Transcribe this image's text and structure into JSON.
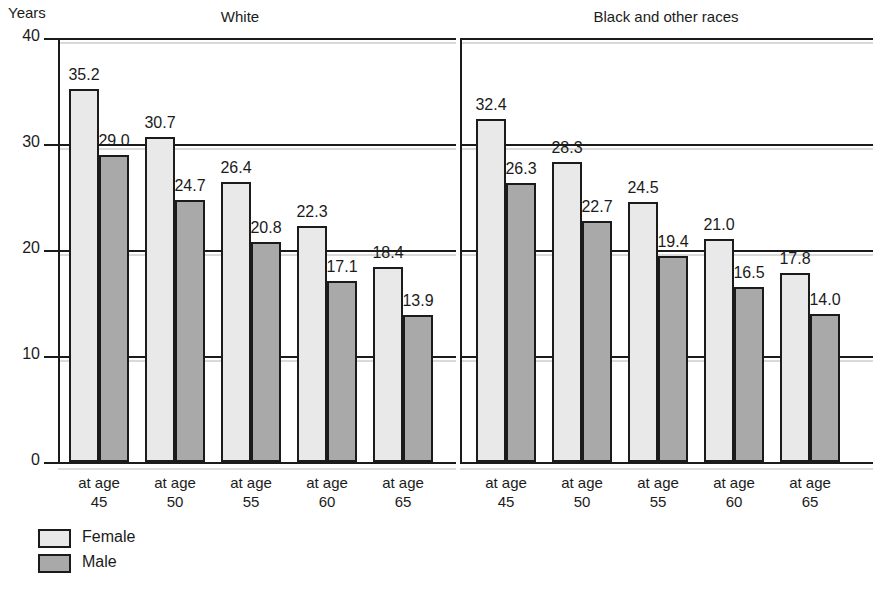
{
  "chart_data": {
    "type": "bar",
    "title": "",
    "ylabel": "Years",
    "xlabel": "",
    "ylim": [
      0,
      40
    ],
    "yticks": [
      0,
      10,
      20,
      30,
      40
    ],
    "ytick_labels": [
      "0",
      "10",
      "20",
      "30",
      "40"
    ],
    "grid": true,
    "legend_position": "bottom-left",
    "categories": [
      "at age\n45",
      "at age\n50",
      "at age\n55",
      "at age\n60",
      "at age\n65"
    ],
    "category_lines": [
      [
        "at age",
        "45"
      ],
      [
        "at age",
        "50"
      ],
      [
        "at age",
        "55"
      ],
      [
        "at age",
        "60"
      ],
      [
        "at age",
        "65"
      ]
    ],
    "panels": [
      {
        "name": "White",
        "series": [
          {
            "name": "Female",
            "color": "#e9e9e9",
            "values": [
              35.2,
              30.7,
              26.4,
              22.3,
              18.4
            ],
            "labels": [
              "35.2",
              "30.7",
              "26.4",
              "22.3",
              "18.4"
            ]
          },
          {
            "name": "Male",
            "color": "#a9a9a9",
            "values": [
              29.0,
              24.7,
              20.8,
              17.1,
              13.9
            ],
            "labels": [
              "29.0",
              "24.7",
              "20.8",
              "17.1",
              "13.9"
            ]
          }
        ]
      },
      {
        "name": "Black and other races",
        "series": [
          {
            "name": "Female",
            "color": "#e9e9e9",
            "values": [
              32.4,
              28.3,
              24.5,
              21.0,
              17.8
            ],
            "labels": [
              "32.4",
              "28.3",
              "24.5",
              "21.0",
              "17.8"
            ]
          },
          {
            "name": "Male",
            "color": "#a9a9a9",
            "values": [
              26.3,
              22.7,
              19.4,
              16.5,
              14.0
            ],
            "labels": [
              "26.3",
              "22.7",
              "19.4",
              "16.5",
              "14.0"
            ]
          }
        ]
      }
    ],
    "legend": [
      {
        "label": "Female",
        "color": "#e9e9e9"
      },
      {
        "label": "Male",
        "color": "#a9a9a9"
      }
    ]
  }
}
